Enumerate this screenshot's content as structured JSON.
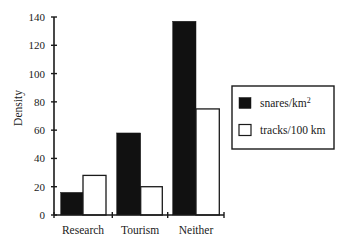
{
  "chart_data": {
    "type": "bar",
    "title": "",
    "xlabel": "",
    "ylabel": "Density",
    "ylim": [
      0,
      140
    ],
    "yticks": [
      0,
      20,
      40,
      60,
      80,
      100,
      120,
      140
    ],
    "grid": false,
    "legend_position": "right",
    "categories": [
      "Research",
      "Tourism",
      "Neither"
    ],
    "series": [
      {
        "name": "snares/km²",
        "label_base": "snares/km",
        "label_sup": "2",
        "fill": "#111111",
        "values": [
          16,
          58,
          137
        ]
      },
      {
        "name": "tracks/100 km",
        "label_base": "tracks/100 km",
        "label_sup": "",
        "fill": "#ffffff",
        "values": [
          28,
          20,
          75
        ]
      }
    ]
  },
  "colors": {
    "axis": "#1a1a1a",
    "bar_dark": "#111111",
    "bar_light": "#ffffff",
    "background": "#ffffff"
  }
}
